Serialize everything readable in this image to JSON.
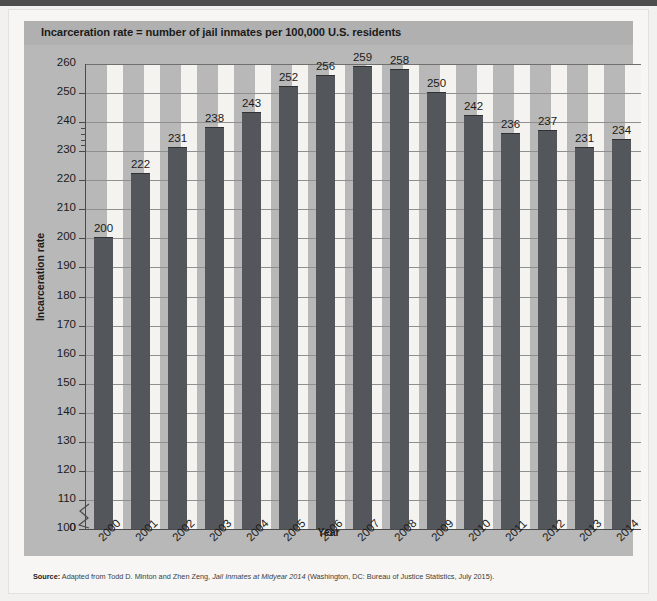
{
  "figure": {
    "title": "Incarceration rate = number of jail inmates per 100,000 U.S. residents",
    "source_prefix": "Source:",
    "source_part1": " Adapted from Todd D. Minton and Zhen Zeng, ",
    "source_italic": "Jail Inmates at Midyear 2014",
    "source_part2": " (Washington, DC: Bureau of Justice Statistics, July 2015)."
  },
  "chart_data": {
    "type": "bar",
    "title": "Incarceration rate = number of jail inmates per 100,000 U.S. residents",
    "xlabel": "Year",
    "ylabel": "Incarceration rate",
    "categories": [
      "2000",
      "2001",
      "2002",
      "2003",
      "2004",
      "2005",
      "2006",
      "2007",
      "2008",
      "2009",
      "2010",
      "2011",
      "2012",
      "2013",
      "2014"
    ],
    "values": [
      200,
      222,
      231,
      238,
      243,
      252,
      256,
      259,
      258,
      250,
      242,
      236,
      237,
      231,
      234
    ],
    "ylim": [
      100,
      260
    ],
    "y_axis_broken": true,
    "y_break_between": [
      0,
      100
    ],
    "yticks": [
      0,
      100,
      110,
      120,
      130,
      140,
      150,
      160,
      170,
      180,
      190,
      200,
      210,
      220,
      230,
      240,
      250,
      260
    ],
    "ytick_labels": [
      "0",
      "100",
      "110",
      "120",
      "130",
      "140",
      "150",
      "160",
      "170",
      "180",
      "190",
      "200",
      "210",
      "220",
      "230",
      "240",
      "250",
      "260"
    ],
    "grid": true,
    "legend": false,
    "bar_color": "#53565a",
    "plot_background": "#b8b8b8",
    "stripe_color": "#f4f3f0",
    "data_labels_shown": true
  }
}
